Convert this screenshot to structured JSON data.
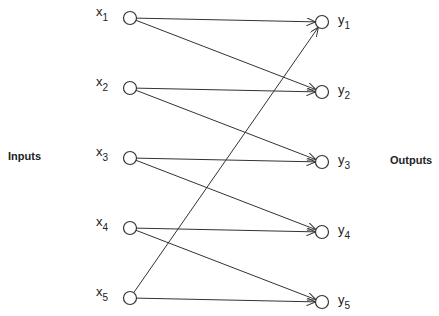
{
  "diagram": {
    "left_label": "Inputs",
    "right_label": "Outputs",
    "inputs": [
      {
        "id": "x1",
        "var": "x",
        "sub": "1"
      },
      {
        "id": "x2",
        "var": "x",
        "sub": "2"
      },
      {
        "id": "x3",
        "var": "x",
        "sub": "3"
      },
      {
        "id": "x4",
        "var": "x",
        "sub": "4"
      },
      {
        "id": "x5",
        "var": "x",
        "sub": "5"
      }
    ],
    "outputs": [
      {
        "id": "y1",
        "var": "y",
        "sub": "1"
      },
      {
        "id": "y2",
        "var": "y",
        "sub": "2"
      },
      {
        "id": "y3",
        "var": "y",
        "sub": "3"
      },
      {
        "id": "y4",
        "var": "y",
        "sub": "4"
      },
      {
        "id": "y5",
        "var": "y",
        "sub": "5"
      }
    ],
    "edges": [
      [
        "x1",
        "y1"
      ],
      [
        "x1",
        "y2"
      ],
      [
        "x2",
        "y2"
      ],
      [
        "x2",
        "y3"
      ],
      [
        "x3",
        "y3"
      ],
      [
        "x3",
        "y4"
      ],
      [
        "x4",
        "y4"
      ],
      [
        "x4",
        "y5"
      ],
      [
        "x5",
        "y5"
      ],
      [
        "x5",
        "y1"
      ]
    ]
  }
}
